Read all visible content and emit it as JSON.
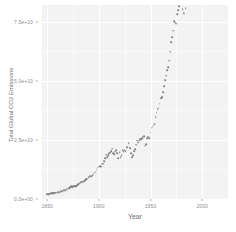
{
  "chart_data": {
    "type": "scatter",
    "title": "",
    "xlabel": "Year",
    "ylabel": "Total Global CO2 Emissions",
    "xlim": [
      1845,
      2025
    ],
    "ylim": [
      0,
      82000000000
    ],
    "grid": true,
    "legend": "none",
    "point_color": "#7d7d7d",
    "panel_color": "#f3f3f3",
    "gridline_color": "#ffffff",
    "xticks": [
      {
        "value": 1850,
        "label": "1850"
      },
      {
        "value": 1900,
        "label": "1900"
      },
      {
        "value": 1950,
        "label": "1950"
      },
      {
        "value": 2000,
        "label": "2000"
      }
    ],
    "yticks": [
      {
        "value": 0,
        "label": "0.0e+00"
      },
      {
        "value": 25000000000,
        "label": "2.5e+10"
      },
      {
        "value": 50000000000,
        "label": "5.0e+10"
      },
      {
        "value": 75000000000,
        "label": "7.5e+10"
      }
    ],
    "x": [
      1850,
      1851,
      1852,
      1853,
      1854,
      1855,
      1856,
      1857,
      1858,
      1859,
      1860,
      1861,
      1862,
      1863,
      1864,
      1865,
      1866,
      1867,
      1868,
      1869,
      1870,
      1871,
      1872,
      1873,
      1874,
      1875,
      1876,
      1877,
      1878,
      1879,
      1880,
      1881,
      1882,
      1883,
      1884,
      1885,
      1886,
      1887,
      1888,
      1889,
      1890,
      1891,
      1892,
      1893,
      1894,
      1895,
      1896,
      1897,
      1898,
      1899,
      1900,
      1901,
      1902,
      1903,
      1904,
      1905,
      1906,
      1907,
      1908,
      1909,
      1910,
      1911,
      1912,
      1913,
      1914,
      1915,
      1916,
      1917,
      1918,
      1919,
      1920,
      1921,
      1922,
      1923,
      1924,
      1925,
      1926,
      1927,
      1928,
      1929,
      1930,
      1931,
      1932,
      1933,
      1934,
      1935,
      1936,
      1937,
      1938,
      1939,
      1940,
      1941,
      1942,
      1943,
      1944,
      1945,
      1946,
      1947,
      1948,
      1949,
      1950,
      1951,
      1952,
      1953,
      1954,
      1955,
      1956,
      1957,
      1958,
      1959,
      1960,
      1961,
      1962,
      1963,
      1964,
      1965,
      1966,
      1967,
      1968,
      1969,
      1970,
      1971,
      1972,
      1973,
      1974,
      1975,
      1976,
      1977,
      1978,
      1979,
      1980,
      1981,
      1982,
      1983,
      1984,
      1985,
      1986,
      1987,
      1988,
      1989,
      1990,
      1991,
      1992,
      1993,
      1994,
      1995,
      1996,
      1997,
      1998,
      1999,
      2000,
      2001,
      2002,
      2003,
      2004,
      2005,
      2006,
      2007,
      2008,
      2009,
      2010,
      2011,
      2012,
      2013,
      2014,
      2015,
      2016,
      2017,
      2018,
      2019,
      2020,
      2021
    ],
    "y": [
      1970000000,
      2040000000,
      2120000000,
      2210000000,
      2380000000,
      2420000000,
      2530000000,
      2580000000,
      2630000000,
      2740000000,
      2880000000,
      2930000000,
      2970000000,
      3200000000,
      3360000000,
      3440000000,
      3610000000,
      3740000000,
      3840000000,
      4090000000,
      4330000000,
      4580000000,
      5010000000,
      5310000000,
      5130000000,
      5420000000,
      5390000000,
      5460000000,
      5400000000,
      5710000000,
      6280000000,
      6500000000,
      6870000000,
      7210000000,
      7270000000,
      7300000000,
      7620000000,
      7950000000,
      8460000000,
      8660000000,
      9290000000,
      9610000000,
      9730000000,
      9760000000,
      10100000000,
      10700000000,
      11100000000,
      11500000000,
      12400000000,
      13200000000,
      13700000000,
      13900000000,
      13700000000,
      15000000000,
      15000000000,
      15900000000,
      17200000000,
      18700000000,
      17800000000,
      18400000000,
      19300000000,
      19600000000,
      20300000000,
      21300000000,
      19500000000,
      19000000000,
      20000000000,
      20600000000,
      19400000000,
      17200000000,
      19700000000,
      17600000000,
      18500000000,
      20700000000,
      20300000000,
      20600000000,
      20100000000,
      21800000000,
      21900000000,
      23500000000,
      21600000000,
      19500000000,
      17700000000,
      18600000000,
      20200000000,
      21200000000,
      23000000000,
      24700000000,
      23800000000,
      24700000000,
      25300000000,
      25400000000,
      25700000000,
      26400000000,
      26600000000,
      22500000000,
      23100000000,
      25600000000,
      26400000000,
      25700000000,
      28000000000,
      30100000000,
      30600000000,
      31400000000,
      31700000000,
      34600000000,
      36500000000,
      38000000000,
      38600000000,
      40300000000,
      42600000000,
      43000000000,
      45100000000,
      47700000000,
      50300000000,
      52200000000,
      54500000000,
      55800000000,
      58500000000,
      62300000000,
      66200000000,
      68400000000,
      71200000000,
      75300000000,
      74500000000,
      74100000000,
      78200000000,
      79900000000,
      81400000000,
      84600000000,
      83500000000,
      80200000000,
      78500000000,
      78300000000,
      80600000000,
      82600000000,
      84600000000,
      86800000000,
      89400000000,
      90900000000,
      91000000000,
      91500000000,
      89700000000,
      89600000000,
      90200000000,
      92000000000,
      94100000000,
      94700000000,
      94900000000,
      94600000000,
      96800000000,
      97600000000,
      98400000000,
      103000000000,
      108000000000,
      112000000000,
      115000000000,
      118000000000,
      119000000000,
      118000000000,
      125000000000,
      130000000000,
      131000000000,
      133000000000,
      134000000000,
      134000000000,
      134000000000,
      136000000000,
      137000000000,
      137000000000,
      130000000000,
      137000000000
    ]
  },
  "axis": {
    "y_title": "Total Global CO2 Emissions",
    "x_title": "Year"
  }
}
